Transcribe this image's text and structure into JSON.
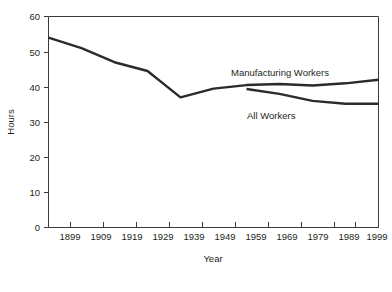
{
  "chart_data": {
    "type": "line",
    "title": "",
    "xlabel": "Year",
    "ylabel": "Hours",
    "xlim": [
      1899,
      1999
    ],
    "ylim": [
      0,
      60
    ],
    "grid": false,
    "legend_position": "inline-annotations",
    "x_ticks": [
      "1899",
      "1909",
      "1919",
      "1929",
      "1939",
      "1949",
      "1959",
      "1969",
      "1979",
      "1989",
      "1999"
    ],
    "y_ticks": [
      "0",
      "10",
      "20",
      "30",
      "40",
      "50",
      "60"
    ],
    "x": [
      1899,
      1909,
      1919,
      1929,
      1939,
      1949,
      1959,
      1969,
      1979,
      1989,
      1999
    ],
    "series": [
      {
        "name": "Manufacturing Workers",
        "color": "#2b2b2b",
        "x": [
          1899,
          1909,
          1919,
          1929,
          1939,
          1949,
          1959,
          1969,
          1979,
          1989,
          1999
        ],
        "values": [
          54.0,
          51.0,
          47.0,
          44.5,
          37.0,
          39.5,
          40.5,
          40.8,
          40.4,
          41.0,
          42.0
        ]
      },
      {
        "name": "All Workers",
        "color": "#2b2b2b",
        "x": [
          1959,
          1969,
          1979,
          1989,
          1999
        ],
        "values": [
          39.4,
          38.0,
          36.0,
          35.2,
          35.2
        ]
      }
    ],
    "annotations": [
      {
        "text": "Manufacturing Workers",
        "x": 1961,
        "y": 44.5
      },
      {
        "text": "All Workers",
        "x": 1966,
        "y": 33.4
      }
    ],
    "axis_color": "#3a3a3a",
    "background": "#ffffff"
  }
}
